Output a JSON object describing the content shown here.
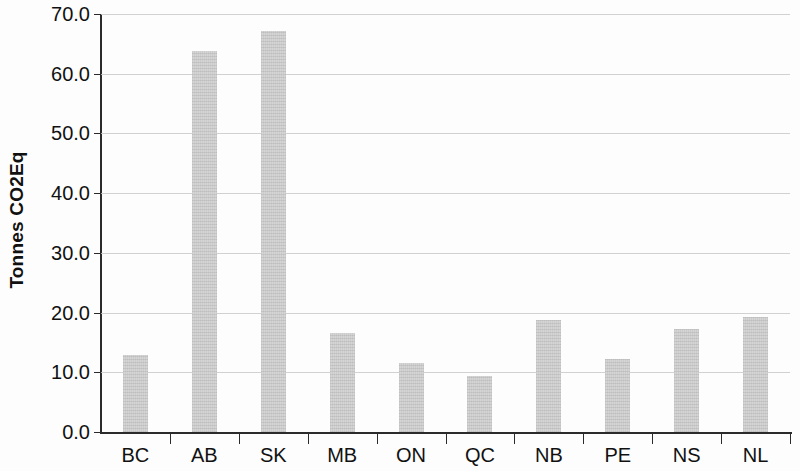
{
  "chart_data": {
    "type": "bar",
    "title": "",
    "subtitle": "",
    "xlabel": "",
    "ylabel": "Tonnes CO2Eq",
    "categories": [
      "BC",
      "AB",
      "SK",
      "MB",
      "ON",
      "QC",
      "NB",
      "PE",
      "NS",
      "NL"
    ],
    "values": [
      12.9,
      63.8,
      67.1,
      16.6,
      11.5,
      9.4,
      18.7,
      12.2,
      17.2,
      19.3
    ],
    "ylim": [
      0.0,
      70.0
    ],
    "ytick_step": 10.0,
    "ytick_labels": [
      "0.0",
      "10.0",
      "20.0",
      "30.0",
      "40.0",
      "50.0",
      "60.0",
      "70.0"
    ],
    "ytick_values": [
      0.0,
      10.0,
      20.0,
      30.0,
      40.0,
      50.0,
      60.0,
      70.0
    ],
    "grid": "horizontal",
    "legend": "none",
    "bar_color": "#d5d5d5",
    "axis_color": "#2b2b2b",
    "gridline_color": "#c9c9c9",
    "background_color": "#fdfdfd"
  }
}
